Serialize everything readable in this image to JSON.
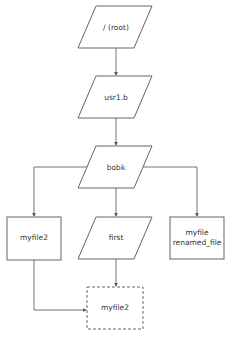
{
  "diagram": {
    "type": "flowchart",
    "colors": {
      "stroke": "#666666",
      "edge": "#777777",
      "text": "#333333",
      "background": "#ffffff"
    },
    "nodes": {
      "root": {
        "label": "/ (root)",
        "shape": "parallelogram"
      },
      "usr1b": {
        "label": "usr1.b",
        "shape": "parallelogram"
      },
      "bobk": {
        "label": "bobk",
        "shape": "parallelogram"
      },
      "myfile2_left": {
        "label": "myfile2",
        "shape": "rectangle"
      },
      "first": {
        "label": "first",
        "shape": "parallelogram"
      },
      "myfile_renamed": {
        "label_line1": "myfile",
        "label_line2": "renamed_file",
        "shape": "rectangle"
      },
      "myfile2_target": {
        "label": "myfile2",
        "shape": "dashed-rectangle"
      }
    },
    "edges": [
      {
        "from": "root",
        "to": "usr1b"
      },
      {
        "from": "usr1b",
        "to": "bobk"
      },
      {
        "from": "bobk",
        "to": "myfile2_left"
      },
      {
        "from": "bobk",
        "to": "first"
      },
      {
        "from": "bobk",
        "to": "myfile_renamed"
      },
      {
        "from": "first",
        "to": "myfile2_target"
      },
      {
        "from": "myfile2_left",
        "to": "myfile2_target"
      }
    ]
  }
}
